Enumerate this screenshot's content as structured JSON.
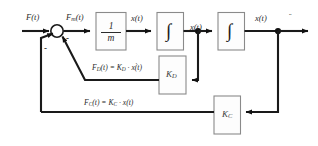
{
  "diagram": {
    "background_color": "#ffffff",
    "line_color": "#1a1a1a",
    "block_fill": "#fdfdfd",
    "block_stroke": "#8a8a8a"
  },
  "signals": {
    "input_force": "F(t)",
    "net_force": "F",
    "net_force_sub": "m",
    "net_force_suffix": "(t)",
    "acceleration": "x(t)",
    "acceleration_dots": "..",
    "velocity": "x(t)",
    "velocity_dots": ".",
    "position": "x(t)"
  },
  "blocks": {
    "plant": {
      "numerator": "1",
      "denominator": "m",
      "name": "1/m"
    },
    "integrator_1": {
      "glyph": "∫",
      "name": "integral"
    },
    "integrator_2": {
      "glyph": "∫",
      "name": "integral"
    },
    "damping_gain": {
      "label": "K",
      "sub": "D"
    },
    "spring_gain": {
      "label": "K",
      "sub": "C"
    }
  },
  "equations": {
    "damping": {
      "lhs": "F",
      "lhs_sub": "D",
      "lhs_arg": "(t) = K",
      "rhs_sub": "D",
      "rhs_tail": " · x(t)",
      "rhs_dots": ".",
      "full": "F_D(t) = K_D · ẋ(t)"
    },
    "spring": {
      "lhs": "F",
      "lhs_sub": "C",
      "lhs_arg": "(t) = K",
      "rhs_sub": "C",
      "rhs_tail": " · x(t)",
      "full": "F_C(t) = K_C · x(t)"
    }
  },
  "summing_junction": {
    "sign_damping": "-",
    "sign_spring": "-",
    "name": "summing-junction"
  }
}
